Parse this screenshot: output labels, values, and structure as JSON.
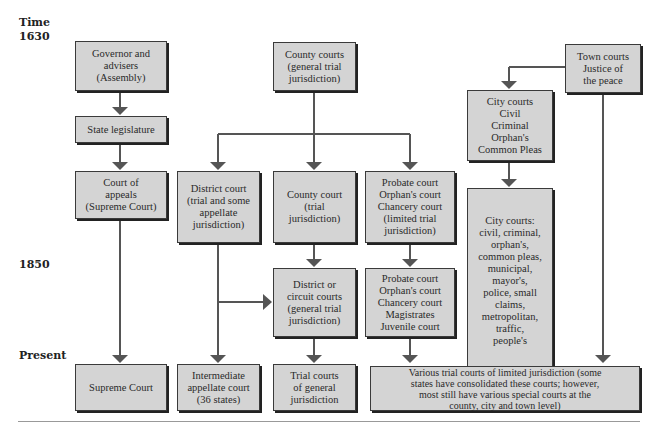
{
  "timeline": {
    "title": "Time",
    "labels": [
      "1630",
      "1850",
      "Present"
    ]
  },
  "boxes": {
    "governor": "Governor and\nadvisers\n(Assembly)",
    "state_legislature": "State legislature",
    "court_of_appeals": "Court of\nappeals\n(Supreme Court)",
    "county_courts_1630": "County courts\n(general trial\njurisdiction)",
    "district_court": "District court\n(trial and some\nappellate\njurisdiction)",
    "county_court_trial": "County court\n(trial\njurisdiction)",
    "probate_limited": "Probate court\nOrphan's court\nChancery court\n(limited trial\njurisdiction)",
    "town_courts": "Town courts\nJustice of\nthe peace",
    "city_courts_1630": "City courts\nCivil\nCriminal\nOrphan's\nCommon Pleas",
    "city_courts_list": "City courts:\ncivil, criminal,\norphan's,\ncommon pleas,\nmunicipal,\nmayor's,\npolice, small\nclaims,\nmetropolitan,\ntraffic,\npeople's",
    "district_or_circuit": "District or\ncircuit courts\n(general trial\njurisdiction)",
    "probate_1850": "Probate court\nOrphan's court\nChancery court\nMagistrates\nJuvenile court",
    "supreme_court": "Supreme Court",
    "intermediate_appellate": "Intermediate\nappellate court\n(36 states)",
    "trial_general": "Trial courts\nof general\njurisdiction",
    "various_limited": "Various trial courts of limited jurisdiction (some\nstates have consolidated these courts; however,\nmost still have various special courts at the\ncounty, city and town level)"
  },
  "colors": {
    "box_fill": "#d4d4d4",
    "box_border": "#3a3a3a",
    "connector": "#555555"
  }
}
